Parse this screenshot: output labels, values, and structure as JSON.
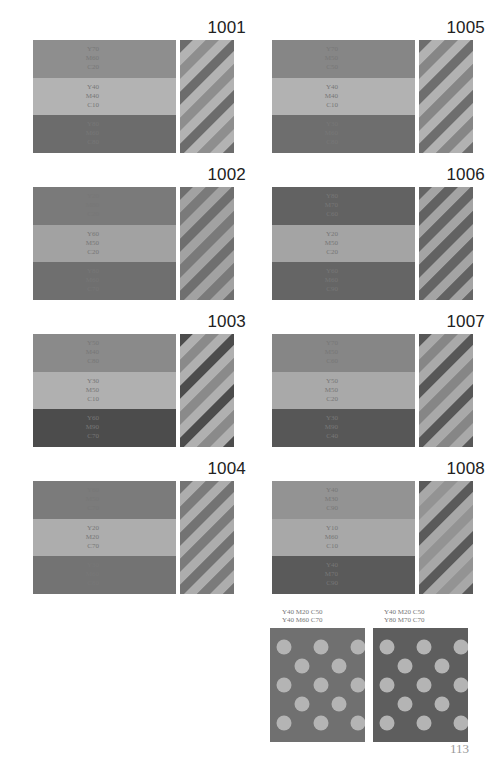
{
  "page": {
    "number": "113"
  },
  "swatches": [
    {
      "id": "1001",
      "bands": [
        {
          "y": "Y70",
          "m": "M60",
          "c": "C20",
          "color": "#8e8e8e"
        },
        {
          "y": "Y40",
          "m": "M40",
          "c": "C10",
          "color": "#b3b3b3"
        },
        {
          "y": "Y80",
          "m": "M60",
          "c": "C80",
          "color": "#6c6c6c"
        }
      ]
    },
    {
      "id": "1002",
      "bands": [
        {
          "y": "Y20",
          "m": "M80",
          "c": "C20",
          "color": "#7a7a7a"
        },
        {
          "y": "Y60",
          "m": "M50",
          "c": "C20",
          "color": "#a2a2a2"
        },
        {
          "y": "Y80",
          "m": "M60",
          "c": "C70",
          "color": "#6f6f6f"
        }
      ]
    },
    {
      "id": "1003",
      "bands": [
        {
          "y": "Y50",
          "m": "M40",
          "c": "C80",
          "color": "#8a8a8a"
        },
        {
          "y": "Y30",
          "m": "M50",
          "c": "C10",
          "color": "#b0b0b0"
        },
        {
          "y": "Y60",
          "m": "M90",
          "c": "C70",
          "color": "#4c4c4c"
        }
      ]
    },
    {
      "id": "1004",
      "bands": [
        {
          "y": "Y60",
          "m": "M50",
          "c": "C70",
          "color": "#7b7b7b"
        },
        {
          "y": "Y20",
          "m": "M20",
          "c": "C70",
          "color": "#adadad"
        },
        {
          "y": "Y30",
          "m": "M60",
          "c": "C80",
          "color": "#737373"
        }
      ]
    },
    {
      "id": "1005",
      "bands": [
        {
          "y": "Y70",
          "m": "M50",
          "c": "C50",
          "color": "#868686"
        },
        {
          "y": "Y40",
          "m": "M40",
          "c": "C10",
          "color": "#b2b2b2"
        },
        {
          "y": "Y30",
          "m": "M60",
          "c": "C80",
          "color": "#6e6e6e"
        }
      ]
    },
    {
      "id": "1006",
      "bands": [
        {
          "y": "Y80",
          "m": "M70",
          "c": "C60",
          "color": "#626262"
        },
        {
          "y": "Y20",
          "m": "M50",
          "c": "C20",
          "color": "#a4a4a4"
        },
        {
          "y": "Y60",
          "m": "M60",
          "c": "C90",
          "color": "#656565"
        }
      ]
    },
    {
      "id": "1007",
      "bands": [
        {
          "y": "Y70",
          "m": "M50",
          "c": "C60",
          "color": "#868686"
        },
        {
          "y": "Y50",
          "m": "M50",
          "c": "C20",
          "color": "#a9a9a9"
        },
        {
          "y": "Y30",
          "m": "M90",
          "c": "C40",
          "color": "#575757"
        }
      ]
    },
    {
      "id": "1008",
      "bands": [
        {
          "y": "Y40",
          "m": "M30",
          "c": "C90",
          "color": "#939393"
        },
        {
          "y": "Y10",
          "m": "M60",
          "c": "C10",
          "color": "#a8a8a8"
        },
        {
          "y": "Y40",
          "m": "M70",
          "c": "C90",
          "color": "#5a5a5a"
        }
      ]
    }
  ],
  "dot_panels": [
    {
      "label_line1": "Y40  M20  C50",
      "label_line2": "Y40  M60  C70",
      "dot_color": "#b4b4b4",
      "bg_color": "#707070"
    },
    {
      "label_line1": "Y40  M20  C50",
      "label_line2": "Y80  M70  C70",
      "dot_color": "#b4b4b4",
      "bg_color": "#5e5e5e"
    }
  ]
}
